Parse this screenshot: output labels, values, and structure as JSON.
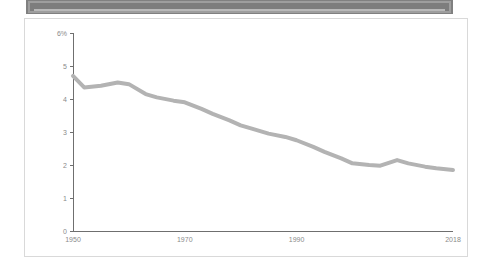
{
  "banner": {
    "name": "top-banner",
    "label": "",
    "color": "#7d7d7d"
  },
  "chart_data": {
    "type": "line",
    "title": "",
    "subtitle": "",
    "xlabel": "",
    "ylabel": "",
    "grid": false,
    "legend": "none",
    "xlim": [
      1950,
      2018
    ],
    "ylim": [
      0,
      6
    ],
    "x_tick_labels": [
      "1950",
      "1970",
      "1990",
      "2018"
    ],
    "x_ticks": [
      1950,
      1970,
      1990,
      2018
    ],
    "y_tick_labels": [
      "0",
      "1",
      "2",
      "3",
      "4",
      "5",
      "6%"
    ],
    "y_ticks": [
      0,
      1,
      2,
      3,
      4,
      5,
      6
    ],
    "series": [
      {
        "name": "rate",
        "color": "#b3b3b3",
        "x": [
          1950,
          1952,
          1955,
          1958,
          1960,
          1963,
          1965,
          1968,
          1970,
          1973,
          1975,
          1978,
          1980,
          1982,
          1985,
          1988,
          1990,
          1993,
          1995,
          1998,
          2000,
          2003,
          2005,
          2008,
          2010,
          2013,
          2015,
          2018
        ],
        "values": [
          4.7,
          4.35,
          4.4,
          4.5,
          4.45,
          4.15,
          4.05,
          3.95,
          3.9,
          3.7,
          3.55,
          3.35,
          3.2,
          3.1,
          2.95,
          2.85,
          2.75,
          2.55,
          2.4,
          2.2,
          2.05,
          2.0,
          1.98,
          2.15,
          2.05,
          1.95,
          1.9,
          1.85
        ]
      }
    ]
  }
}
